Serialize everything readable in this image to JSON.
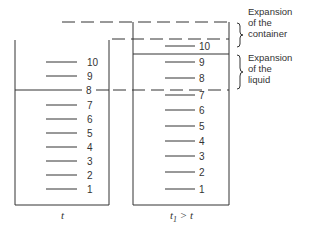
{
  "left_container": {
    "caption": "t",
    "marks": [
      "10",
      "9",
      "8",
      "7",
      "6",
      "5",
      "4",
      "3",
      "2",
      "1"
    ],
    "liquid_level_label": "8"
  },
  "right_container": {
    "caption": "t₁ > t",
    "caption_t1": "t",
    "caption_sub": "1",
    "caption_rest": " > t",
    "marks": [
      "10",
      "9",
      "8",
      "7",
      "6",
      "5",
      "4",
      "3",
      "2",
      "1"
    ]
  },
  "annotations": {
    "container_expansion": [
      "Expansion",
      "of the",
      "container"
    ],
    "liquid_expansion": [
      "Expansion",
      "of the",
      "liquid"
    ]
  },
  "colors": {
    "line": "#333333",
    "background": "#ffffff"
  }
}
